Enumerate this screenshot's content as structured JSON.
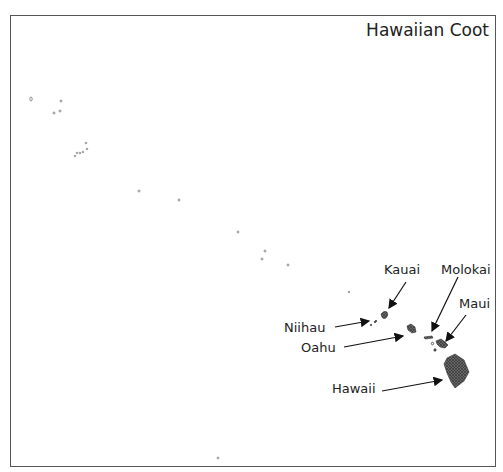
{
  "map": {
    "title": "Hawaiian Coot",
    "labels": {
      "kauai": "Kauai",
      "molokai": "Molokai",
      "maui": "Maui",
      "niihau": "Niihau",
      "oahu": "Oahu",
      "hawaii": "Hawaii"
    },
    "colors": {
      "border": "#555555",
      "island_fill": "#555555",
      "text": "#222222"
    }
  }
}
